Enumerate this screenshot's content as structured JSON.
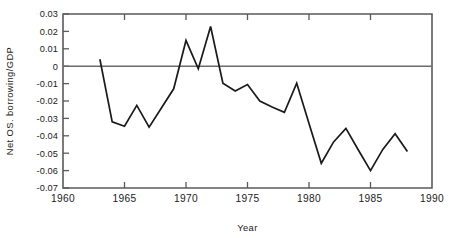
{
  "chart_data": {
    "type": "line",
    "title": "",
    "xlabel": "Year",
    "ylabel": "Net OS. borrowing/GDP",
    "xlim": [
      1960,
      1990
    ],
    "ylim": [
      -0.07,
      0.03
    ],
    "grid": false,
    "legend": null,
    "zero_reference_line": 0,
    "xticks": [
      1960,
      1965,
      1970,
      1975,
      1980,
      1985,
      1990
    ],
    "xticklabels": [
      "1960",
      "1965",
      "1970",
      "1975",
      "1980",
      "1985",
      "1990"
    ],
    "yticks": [
      0.03,
      0.02,
      0.01,
      0,
      -0.01,
      -0.02,
      -0.03,
      -0.04,
      -0.05,
      -0.06,
      -0.07
    ],
    "yticklabels": [
      "0.03",
      "0.02",
      "0.01",
      "0",
      "-0.01",
      "-0.02",
      "-0.03",
      "-0.04",
      "-0.05",
      "-0.06",
      "-0.07"
    ],
    "x": [
      1963,
      1964,
      1965,
      1966,
      1967,
      1968,
      1969,
      1970,
      1971,
      1972,
      1973,
      1974,
      1975,
      1976,
      1977,
      1978,
      1979,
      1980,
      1981,
      1982,
      1983,
      1984,
      1985,
      1986,
      1987,
      1988
    ],
    "values": [
      0.004,
      -0.032,
      -0.0345,
      -0.0225,
      -0.035,
      -0.024,
      -0.013,
      0.0148,
      -0.0015,
      0.0228,
      -0.0098,
      -0.0142,
      -0.0105,
      -0.02,
      -0.0235,
      -0.0265,
      -0.0098,
      -0.033,
      -0.0558,
      -0.0435,
      -0.0357,
      -0.048,
      -0.06,
      -0.0478,
      -0.0388,
      -0.049
    ],
    "series": [
      {
        "name": "Net OS. borrowing/GDP",
        "color": "#1a1a1a",
        "x": [
          1963,
          1964,
          1965,
          1966,
          1967,
          1968,
          1969,
          1970,
          1971,
          1972,
          1973,
          1974,
          1975,
          1976,
          1977,
          1978,
          1979,
          1980,
          1981,
          1982,
          1983,
          1984,
          1985,
          1986,
          1987,
          1988
        ],
        "values": [
          0.004,
          -0.032,
          -0.0345,
          -0.0225,
          -0.035,
          -0.024,
          -0.013,
          0.0148,
          -0.0015,
          0.0228,
          -0.0098,
          -0.0142,
          -0.0105,
          -0.02,
          -0.0235,
          -0.0265,
          -0.0098,
          -0.033,
          -0.0558,
          -0.0435,
          -0.0357,
          -0.048,
          -0.06,
          -0.0478,
          -0.0388,
          -0.049
        ]
      }
    ]
  },
  "colors": {
    "line": "#1a1a1a",
    "axis": "#5a5a5a",
    "zero": "#6b6b6b",
    "background": "#ffffff"
  }
}
